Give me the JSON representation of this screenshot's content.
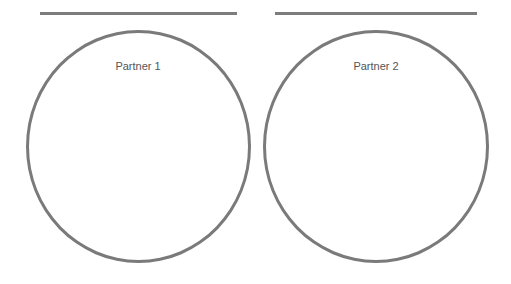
{
  "partners": [
    {
      "label": "Partner 1"
    },
    {
      "label": "Partner 2"
    }
  ],
  "colors": {
    "stroke": "#7a7a7a",
    "text": "#555555",
    "background": "#ffffff"
  }
}
